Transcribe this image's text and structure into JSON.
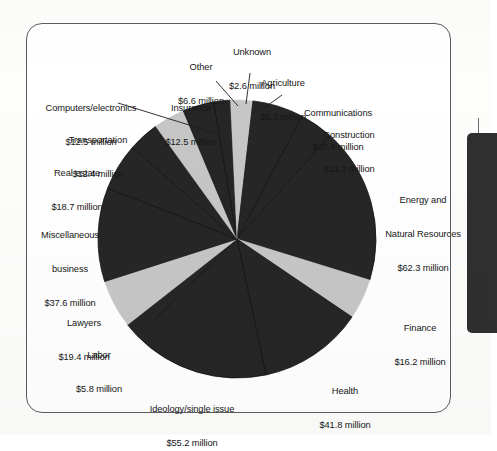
{
  "page": {
    "background_color": "#fdfdfc",
    "frame_border_color": "#5d5d5d",
    "side_tab_color": "#2f2f2f"
  },
  "chart_data": {
    "type": "pie",
    "title": "",
    "subtitle": "",
    "xlabel": "",
    "ylabel": "",
    "legend_position": "callout-labels",
    "grid": false,
    "unit": "million USD",
    "value_format": "$%s million",
    "total": 343.6,
    "colors": {
      "dark": "#262626",
      "light": "#c6c6c6",
      "separator": "#111111",
      "label_text": "#161616"
    },
    "start_angle_deg": -90,
    "direction": "clockwise",
    "categories": [
      "Agriculture",
      "Communications",
      "Construction",
      "Energy and Natural Resources",
      "Finance",
      "Health",
      "Ideology/single issue",
      "Labor",
      "Lawyers",
      "Miscellaneous business",
      "Real estate",
      "Transportation",
      "Computers/electronics",
      "Insurance",
      "Other",
      "Unknown"
    ],
    "values": [
      6.3,
      20.4,
      13.3,
      62.3,
      16.2,
      41.8,
      55.2,
      5.8,
      19.4,
      37.6,
      18.7,
      12.4,
      12.5,
      12.5,
      6.6,
      2.6
    ],
    "slices": [
      {
        "name": "Agriculture",
        "value": 6.3,
        "value_text": "$6.3 million",
        "shade": "light"
      },
      {
        "name": "Communications",
        "value": 20.4,
        "value_text": "$20.4 million",
        "shade": "dark"
      },
      {
        "name": "Construction",
        "value": 13.3,
        "value_text": "$13.3 million",
        "shade": "dark"
      },
      {
        "name": "Energy and Natural Resources",
        "value": 62.3,
        "value_text": "$62.3 million",
        "shade": "dark"
      },
      {
        "name": "Finance",
        "value": 16.2,
        "value_text": "$16.2 million",
        "shade": "light"
      },
      {
        "name": "Health",
        "value": 41.8,
        "value_text": "$41.8 million",
        "shade": "dark"
      },
      {
        "name": "Ideology/single issue",
        "value": 55.2,
        "value_text": "$55.2 million",
        "shade": "dark"
      },
      {
        "name": "Labor",
        "value": 5.8,
        "value_text": "$5.8 million",
        "shade": "dark"
      },
      {
        "name": "Lawyers",
        "value": 19.4,
        "value_text": "$19.4 million",
        "shade": "light"
      },
      {
        "name": "Miscellaneous business",
        "value": 37.6,
        "value_text": "$37.6 million",
        "shade": "dark"
      },
      {
        "name": "Real estate",
        "value": 18.7,
        "value_text": "$18.7 million",
        "shade": "dark"
      },
      {
        "name": "Transportation",
        "value": 12.4,
        "value_text": "$12.4 million",
        "shade": "dark"
      },
      {
        "name": "Computers/electronics",
        "value": 12.5,
        "value_text": "$12.5 million",
        "shade": "light"
      },
      {
        "name": "Insurance",
        "value": 12.5,
        "value_text": "$12.5 million",
        "shade": "dark"
      },
      {
        "name": "Other",
        "value": 6.6,
        "value_text": "$6.6 million",
        "shade": "dark"
      },
      {
        "name": "Unknown",
        "value": 2.6,
        "value_text": "$2.6 million",
        "shade": "light"
      }
    ]
  },
  "labels": {
    "other": {
      "name": "Other",
      "value": "$6.6 million"
    },
    "unknown": {
      "name": "Unknown",
      "value": "$2.6 million"
    },
    "agriculture": {
      "name": "Agriculture",
      "value": "$6.3 million"
    },
    "communications": {
      "name": "Communications",
      "value": "$20.4 million"
    },
    "construction": {
      "name": "Construction",
      "value": "$13.3 million"
    },
    "energy": {
      "name_line1": "Energy and",
      "name_line2": "Natural Resources",
      "value": "$62.3 million"
    },
    "finance": {
      "name": "Finance",
      "value": "$16.2 million"
    },
    "health": {
      "name": "Health",
      "value": "$41.8 million"
    },
    "ideology": {
      "name": "Ideology/single issue",
      "value": "$55.2 million"
    },
    "labor": {
      "name": "Labor",
      "value": "$5.8 million"
    },
    "lawyers": {
      "name": "Lawyers",
      "value": "$19.4 million"
    },
    "misc_business": {
      "name_line1": "Miscellaneous",
      "name_line2": "business",
      "value": "$37.6 million"
    },
    "real_estate": {
      "name": "Real estate",
      "value": "$18.7 million"
    },
    "transportation": {
      "name": "Transportation",
      "value": "$12.4 million"
    },
    "computers": {
      "name": "Computers/electronics",
      "value": "$12.5 million"
    },
    "insurance": {
      "name": "Insurance",
      "value": "$12.5 million"
    }
  }
}
